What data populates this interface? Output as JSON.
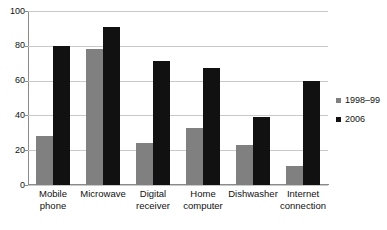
{
  "chart_data": {
    "type": "bar",
    "title": "",
    "subtitle": "",
    "xlabel": "",
    "ylabel": "",
    "ylim": [
      0,
      100
    ],
    "yticks": [
      0,
      20,
      40,
      60,
      80,
      100
    ],
    "grid": true,
    "legend_position": "right",
    "categories": [
      "Mobile phone",
      "Microwave",
      "Digital receiver",
      "Home computer",
      "Dishwasher",
      "Internet connection"
    ],
    "category_lines": [
      [
        "Mobile",
        "phone"
      ],
      [
        "Microwave",
        ""
      ],
      [
        "Digital",
        "receiver"
      ],
      [
        "Home",
        "computer"
      ],
      [
        "Dishwasher",
        ""
      ],
      [
        "Internet",
        "connection"
      ]
    ],
    "series": [
      {
        "name": "1998–99",
        "color": "#808080",
        "values": [
          28,
          78,
          24,
          33,
          23,
          11
        ]
      },
      {
        "name": "2006",
        "color": "#111111",
        "values": [
          80,
          91,
          71,
          67,
          39,
          60
        ]
      }
    ]
  },
  "colors": {
    "series_1998_99": "#808080",
    "series_2006": "#111111",
    "gridline": "#c9c9c9",
    "axis": "#8a8a8a",
    "background": "#ffffff",
    "text": "#111111"
  }
}
